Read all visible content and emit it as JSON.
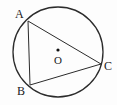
{
  "figure": {
    "type": "geometry-diagram",
    "background_color": "#fdfdfd",
    "stroke_color": "#2b2b2b",
    "label_color": "#1a1a1a",
    "circle": {
      "center_x": 58,
      "center_y": 52,
      "radius": 45,
      "stroke_width": 1.3,
      "fill": "none"
    },
    "center_dot": {
      "x": 58,
      "y": 50,
      "radius": 1.6,
      "fill": "#111111"
    },
    "labels": {
      "A": "A",
      "B": "B",
      "C": "C",
      "O": "O"
    },
    "points": [
      {
        "name": "A",
        "x": 28,
        "y": 21
      },
      {
        "name": "B",
        "x": 30,
        "y": 85
      },
      {
        "name": "C",
        "x": 101,
        "y": 64
      },
      {
        "name": "O",
        "x": 58,
        "y": 50
      }
    ],
    "segments": [
      {
        "name": "AB",
        "x1": 28,
        "y1": 21,
        "x2": 30,
        "y2": 85,
        "stroke_width": 1.0
      },
      {
        "name": "AC",
        "x1": 28,
        "y1": 21,
        "x2": 101,
        "y2": 64,
        "stroke_width": 1.0
      },
      {
        "name": "BC",
        "x1": 30,
        "y1": 85,
        "x2": 101,
        "y2": 64,
        "stroke_width": 1.0
      }
    ]
  }
}
